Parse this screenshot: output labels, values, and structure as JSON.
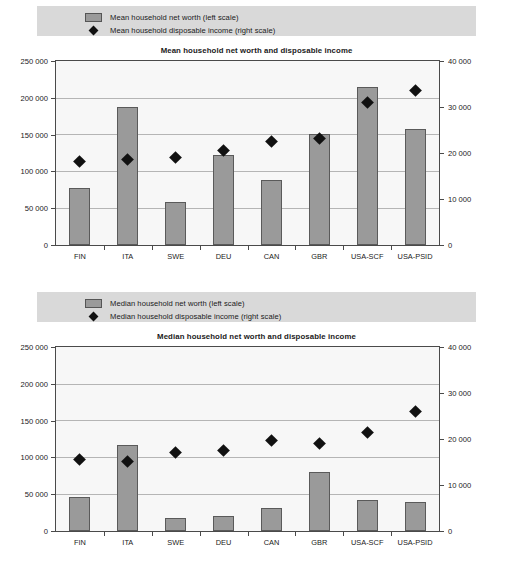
{
  "charts": [
    {
      "legend": {
        "bar_label": "Mean household net worth (left scale)",
        "marker_label": "Mean household disposable income (right scale)"
      },
      "title": "Mean household net worth and disposable income",
      "chart_data": {
        "type": "bar",
        "title": "Mean household net worth and disposable income",
        "xlabel": "",
        "ylabel": "",
        "categories": [
          "FIN",
          "ITA",
          "SWE",
          "DEU",
          "CAN",
          "GBR",
          "USA-SCF",
          "USA-PSID"
        ],
        "series": [
          {
            "name": "Mean household net worth (left scale)",
            "type": "bar",
            "axis": "left",
            "values": [
              78000,
              188000,
              59000,
              123000,
              89000,
              151000,
              215000,
              159000
            ]
          },
          {
            "name": "Mean household disposable income (right scale)",
            "type": "scatter",
            "axis": "right",
            "values": [
              18000,
              18500,
              19000,
              20500,
              22500,
              23000,
              31000,
              33500
            ]
          }
        ],
        "ylim": [
          0,
          250000
        ],
        "y2lim": [
          0,
          40000
        ],
        "yticks": [
          0,
          50000,
          100000,
          150000,
          200000,
          250000
        ],
        "y2ticks": [
          0,
          10000,
          20000,
          30000,
          40000
        ],
        "ytick_labels": [
          "0",
          "50 000",
          "100 000",
          "150 000",
          "200 000",
          "250 000"
        ],
        "y2tick_labels": [
          "0",
          "10 000",
          "20 000",
          "30 000",
          "40 000"
        ],
        "grid": true,
        "legend_position": "top-left"
      }
    },
    {
      "legend": {
        "bar_label": "Median household net worth (left scale)",
        "marker_label": "Median household disposable income (right scale)"
      },
      "title": "Median household net worth and disposable income",
      "chart_data": {
        "type": "bar",
        "title": "Median household net worth and disposable income",
        "xlabel": "",
        "ylabel": "",
        "categories": [
          "FIN",
          "ITA",
          "SWE",
          "DEU",
          "CAN",
          "GBR",
          "USA-SCF",
          "USA-PSID"
        ],
        "series": [
          {
            "name": "Median household net worth (left scale)",
            "type": "bar",
            "axis": "left",
            "values": [
              47000,
              118000,
              18000,
              20000,
              31000,
              80000,
              43000,
              39000
            ]
          },
          {
            "name": "Median household disposable income (right scale)",
            "type": "scatter",
            "axis": "right",
            "values": [
              15500,
              15000,
              17000,
              17500,
              19500,
              19000,
              21300,
              26000
            ]
          }
        ],
        "ylim": [
          0,
          250000
        ],
        "y2lim": [
          0,
          40000
        ],
        "yticks": [
          0,
          50000,
          100000,
          150000,
          200000,
          250000
        ],
        "y2ticks": [
          0,
          10000,
          20000,
          30000,
          40000
        ],
        "ytick_labels": [
          "0",
          "50 000",
          "100 000",
          "150 000",
          "200 000",
          "250 000"
        ],
        "y2tick_labels": [
          "0",
          "10 000",
          "20 000",
          "30 000",
          "40 000"
        ],
        "grid": true,
        "legend_position": "top-left"
      }
    }
  ],
  "colors": {
    "bar_fill": "#9a9a9a",
    "bar_stroke": "#5a5a5a",
    "marker": "#111111",
    "legend_bg": "#d9d9d9",
    "plot_bg": "#f7f7f7",
    "gridline": "#b5b5b5",
    "axis": "#4a4a4a"
  }
}
